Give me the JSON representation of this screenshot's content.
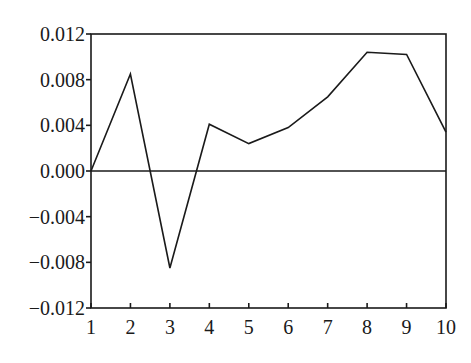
{
  "chart_data": {
    "type": "line",
    "title": "",
    "xlabel": "",
    "ylabel": "",
    "x": [
      1,
      2,
      3,
      4,
      5,
      6,
      7,
      8,
      9,
      10
    ],
    "series": [
      {
        "name": "response",
        "values": [
          0.0,
          0.0085,
          -0.0085,
          0.0041,
          0.0024,
          0.0038,
          0.0065,
          0.0104,
          0.0102,
          0.0034
        ],
        "color": "#1a1a1a"
      }
    ],
    "xlim": [
      1,
      10
    ],
    "ylim": [
      -0.012,
      0.012
    ],
    "x_ticks": [
      "1",
      "2",
      "3",
      "4",
      "5",
      "6",
      "7",
      "8",
      "9",
      "10"
    ],
    "y_ticks": [
      "0.012",
      "0.008",
      "0.004",
      "0.000",
      "-0.004",
      "-0.008",
      "-0.012"
    ],
    "y_tick_values": [
      0.012,
      0.008,
      0.004,
      0.0,
      -0.004,
      -0.008,
      -0.012
    ],
    "zero_line": true,
    "grid": false,
    "legend": null
  }
}
